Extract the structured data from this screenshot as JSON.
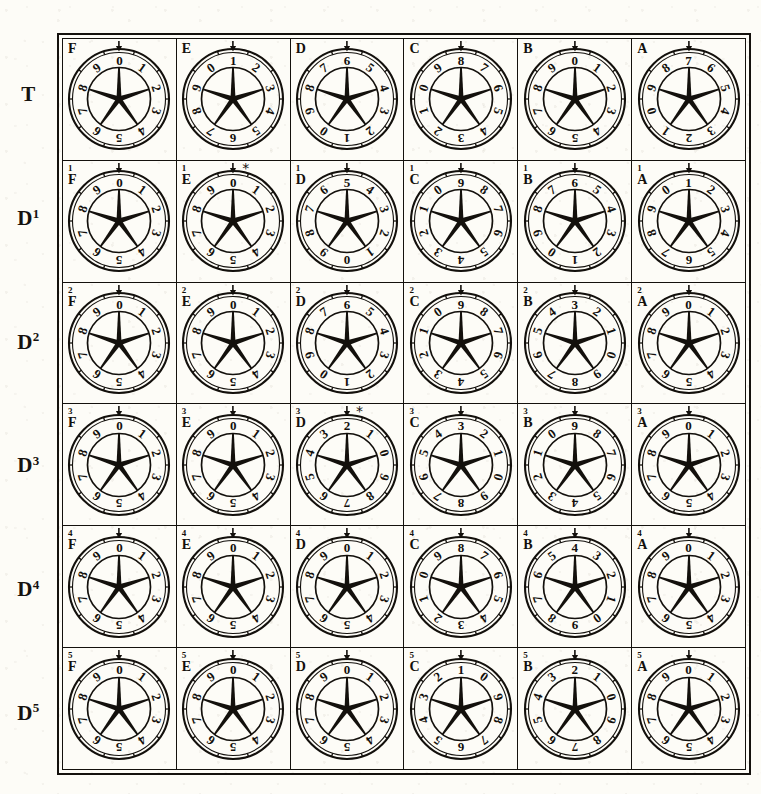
{
  "figure": {
    "ink_color": "#13100c",
    "paper_color": "#fdfcf7"
  },
  "row_labels": [
    {
      "name": "T",
      "base": "T",
      "superscript": ""
    },
    {
      "name": "D1",
      "base": "D",
      "superscript": "1"
    },
    {
      "name": "D2",
      "base": "D",
      "superscript": "2"
    },
    {
      "name": "D3",
      "base": "D",
      "superscript": "3"
    },
    {
      "name": "D4",
      "base": "D",
      "superscript": "4"
    },
    {
      "name": "D5",
      "base": "D",
      "superscript": "5"
    }
  ],
  "column_letters": [
    "F",
    "E",
    "D",
    "C",
    "B",
    "A"
  ],
  "digits": [
    "0",
    "1",
    "2",
    "3",
    "4",
    "5",
    "6",
    "7",
    "8",
    "9"
  ],
  "markers": {
    "pointer": "down-arrow-marker",
    "asterisk": "*"
  },
  "grid": [
    {
      "row": "T",
      "cells": [
        {
          "label": "F",
          "superscript": "",
          "top_digit": "0",
          "direction": "cw",
          "asterisk": false
        },
        {
          "label": "E",
          "superscript": "",
          "top_digit": "1",
          "direction": "cw",
          "asterisk": false
        },
        {
          "label": "D",
          "superscript": "",
          "top_digit": "6",
          "direction": "ccw",
          "asterisk": false
        },
        {
          "label": "C",
          "superscript": "",
          "top_digit": "8",
          "direction": "ccw",
          "asterisk": false
        },
        {
          "label": "B",
          "superscript": "",
          "top_digit": "0",
          "direction": "cw",
          "asterisk": false
        },
        {
          "label": "A",
          "superscript": "",
          "top_digit": "7",
          "direction": "ccw",
          "asterisk": false
        }
      ]
    },
    {
      "row": "D1",
      "cells": [
        {
          "label": "F",
          "superscript": "1",
          "top_digit": "0",
          "direction": "cw",
          "asterisk": false
        },
        {
          "label": "E",
          "superscript": "1",
          "top_digit": "0",
          "direction": "cw",
          "asterisk": true
        },
        {
          "label": "D",
          "superscript": "1",
          "top_digit": "5",
          "direction": "ccw",
          "asterisk": false
        },
        {
          "label": "C",
          "superscript": "1",
          "top_digit": "9",
          "direction": "ccw",
          "asterisk": false
        },
        {
          "label": "B",
          "superscript": "1",
          "top_digit": "6",
          "direction": "ccw",
          "asterisk": false
        },
        {
          "label": "A",
          "superscript": "1",
          "top_digit": "1",
          "direction": "cw",
          "asterisk": false
        }
      ]
    },
    {
      "row": "D2",
      "cells": [
        {
          "label": "F",
          "superscript": "2",
          "top_digit": "0",
          "direction": "cw",
          "asterisk": false
        },
        {
          "label": "E",
          "superscript": "2",
          "top_digit": "0",
          "direction": "cw",
          "asterisk": false
        },
        {
          "label": "D",
          "superscript": "2",
          "top_digit": "6",
          "direction": "ccw",
          "asterisk": false
        },
        {
          "label": "C",
          "superscript": "2",
          "top_digit": "9",
          "direction": "ccw",
          "asterisk": false
        },
        {
          "label": "B",
          "superscript": "2",
          "top_digit": "3",
          "direction": "ccw",
          "asterisk": false
        },
        {
          "label": "A",
          "superscript": "2",
          "top_digit": "0",
          "direction": "cw",
          "asterisk": false
        }
      ]
    },
    {
      "row": "D3",
      "cells": [
        {
          "label": "F",
          "superscript": "3",
          "top_digit": "0",
          "direction": "cw",
          "asterisk": false
        },
        {
          "label": "E",
          "superscript": "3",
          "top_digit": "0",
          "direction": "cw",
          "asterisk": false
        },
        {
          "label": "D",
          "superscript": "3",
          "top_digit": "2",
          "direction": "ccw",
          "asterisk": true
        },
        {
          "label": "C",
          "superscript": "3",
          "top_digit": "3",
          "direction": "ccw",
          "asterisk": false
        },
        {
          "label": "B",
          "superscript": "3",
          "top_digit": "9",
          "direction": "ccw",
          "asterisk": false
        },
        {
          "label": "A",
          "superscript": "3",
          "top_digit": "0",
          "direction": "cw",
          "asterisk": false
        }
      ]
    },
    {
      "row": "D4",
      "cells": [
        {
          "label": "F",
          "superscript": "4",
          "top_digit": "0",
          "direction": "cw",
          "asterisk": false
        },
        {
          "label": "E",
          "superscript": "4",
          "top_digit": "0",
          "direction": "cw",
          "asterisk": false
        },
        {
          "label": "D",
          "superscript": "4",
          "top_digit": "0",
          "direction": "cw",
          "asterisk": false
        },
        {
          "label": "C",
          "superscript": "4",
          "top_digit": "8",
          "direction": "ccw",
          "asterisk": false
        },
        {
          "label": "B",
          "superscript": "4",
          "top_digit": "4",
          "direction": "ccw",
          "asterisk": false
        },
        {
          "label": "A",
          "superscript": "4",
          "top_digit": "0",
          "direction": "cw",
          "asterisk": false
        }
      ]
    },
    {
      "row": "D5",
      "cells": [
        {
          "label": "F",
          "superscript": "5",
          "top_digit": "0",
          "direction": "cw",
          "asterisk": false
        },
        {
          "label": "E",
          "superscript": "5",
          "top_digit": "0",
          "direction": "cw",
          "asterisk": false
        },
        {
          "label": "D",
          "superscript": "5",
          "top_digit": "0",
          "direction": "cw",
          "asterisk": false
        },
        {
          "label": "C",
          "superscript": "5",
          "top_digit": "1",
          "direction": "ccw",
          "asterisk": false
        },
        {
          "label": "B",
          "superscript": "5",
          "top_digit": "2",
          "direction": "ccw",
          "asterisk": false
        },
        {
          "label": "A",
          "superscript": "5",
          "top_digit": "0",
          "direction": "cw",
          "asterisk": false
        }
      ]
    }
  ]
}
